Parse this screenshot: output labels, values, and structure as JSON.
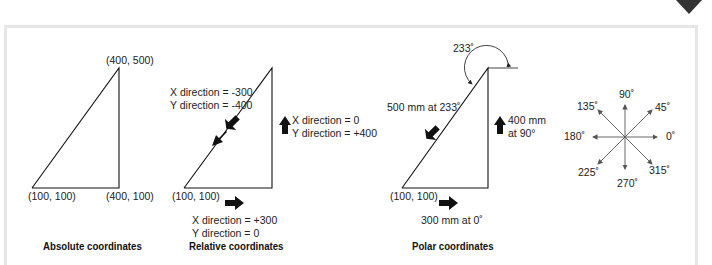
{
  "absolute": {
    "caption": "Absolute coordinates",
    "top": "(400, 500)",
    "bottom_left": "(100, 100)",
    "bottom_right": "(400, 100)"
  },
  "relative": {
    "caption": "Relative coordinates",
    "diag_x": "X direction = -300",
    "diag_y": "Y direction = -400",
    "vert_x": "X direction = 0",
    "vert_y": "Y direction = +400",
    "bottom_left": "(100, 100)",
    "horiz_x": "X direction = +300",
    "horiz_y": "Y direction = 0"
  },
  "polar": {
    "caption": "Polar coordinates",
    "angle": "233˚",
    "diag": "500 mm at  233˚",
    "vert_1": "400 mm",
    "vert_2": "at 90°",
    "bottom_left": "(100, 100)",
    "horiz": "300 mm at  0˚"
  },
  "compass": {
    "a90": "90˚",
    "a45": "45˚",
    "a135": "135˚",
    "a180": "180˚",
    "a0": "0˚",
    "a225": "225˚",
    "a315": "315˚",
    "a270": "270˚"
  },
  "colors": {
    "frame": "#e6e6e6",
    "line": "#111111",
    "compass": "#555555"
  }
}
